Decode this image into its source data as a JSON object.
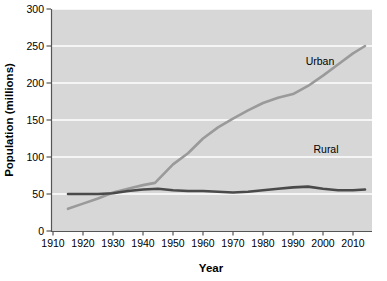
{
  "chart_data": {
    "type": "line",
    "title": "",
    "xlabel": "Year",
    "ylabel": "Population (millions)",
    "xlim": [
      1910,
      2014
    ],
    "ylim": [
      0,
      300
    ],
    "xticks": [
      1910,
      1920,
      1930,
      1940,
      1950,
      1960,
      1970,
      1980,
      1990,
      2000,
      2010
    ],
    "yticks": [
      0,
      50,
      100,
      150,
      200,
      250,
      300
    ],
    "grid": "horizontal",
    "legend_position": "inline-labels",
    "series": [
      {
        "name": "Urban",
        "color": "#9a9a9a",
        "label_x": 1999,
        "label_y": 225,
        "x": [
          1915,
          1920,
          1925,
          1930,
          1935,
          1940,
          1944,
          1950,
          1955,
          1960,
          1965,
          1970,
          1975,
          1980,
          1985,
          1990,
          1995,
          2000,
          2005,
          2010,
          2014
        ],
        "values": [
          30,
          37,
          44,
          52,
          57,
          62,
          65,
          90,
          105,
          125,
          140,
          152,
          163,
          173,
          180,
          185,
          196,
          210,
          225,
          240,
          250
        ]
      },
      {
        "name": "Rural",
        "color": "#4a4a4a",
        "label_x": 2001,
        "label_y": 105,
        "x": [
          1915,
          1920,
          1925,
          1930,
          1935,
          1940,
          1945,
          1950,
          1955,
          1960,
          1965,
          1970,
          1975,
          1980,
          1985,
          1990,
          1995,
          2000,
          2005,
          2010,
          2014
        ],
        "values": [
          50,
          50,
          50,
          51,
          54,
          56,
          57,
          55,
          54,
          54,
          53,
          52,
          53,
          55,
          57,
          59,
          60,
          57,
          55,
          55,
          56
        ]
      }
    ]
  },
  "axis": {
    "x_title": "Year",
    "y_title": "Population (millions)",
    "x_tick_labels": [
      "1910",
      "1920",
      "1930",
      "1940",
      "1950",
      "1960",
      "1970",
      "1980",
      "1990",
      "2000",
      "2010"
    ],
    "y_tick_labels": [
      "0",
      "50",
      "100",
      "150",
      "200",
      "250",
      "300"
    ]
  },
  "labels": {
    "urban": "Urban",
    "rural": "Rural"
  },
  "colors": {
    "plot_background": "#d7d7d7",
    "gridline": "#ffffff",
    "axis": "#555555",
    "urban_line": "#9a9a9a",
    "rural_line": "#4a4a4a",
    "text": "#000000",
    "page_background": "#ffffff"
  }
}
